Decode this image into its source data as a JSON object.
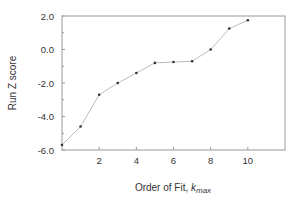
{
  "chart_data": {
    "type": "line",
    "title": "",
    "xlabel": "Order of Fit, ",
    "xlabel_italic": "k",
    "xlabel_sub": "max",
    "ylabel": "Run Z score",
    "x": [
      0,
      1,
      2,
      3,
      4,
      5,
      6,
      7,
      8,
      9,
      10
    ],
    "series": [
      {
        "name": "Run Z score",
        "values": [
          -5.7,
          -4.6,
          -2.7,
          -2.0,
          -1.4,
          -0.8,
          -0.75,
          -0.7,
          0.0,
          1.25,
          1.75
        ]
      }
    ],
    "xlim": [
      0,
      12
    ],
    "ylim": [
      -6.0,
      2.0
    ],
    "x_ticks": [
      2,
      4,
      6,
      8,
      10
    ],
    "x_tick_labels": [
      "2",
      "4",
      "6",
      "8",
      "10"
    ],
    "y_ticks": [
      -6.0,
      -4.0,
      -2.0,
      0.0,
      2.0
    ],
    "y_tick_labels": [
      "-6.0",
      "-4.0",
      "-2.0",
      "0.0",
      "2.0"
    ],
    "grid": false,
    "legend": "none",
    "colors": {
      "line": "#bdbdbd",
      "marker": "#333333",
      "axis": "#999999",
      "text": "#333333"
    }
  }
}
